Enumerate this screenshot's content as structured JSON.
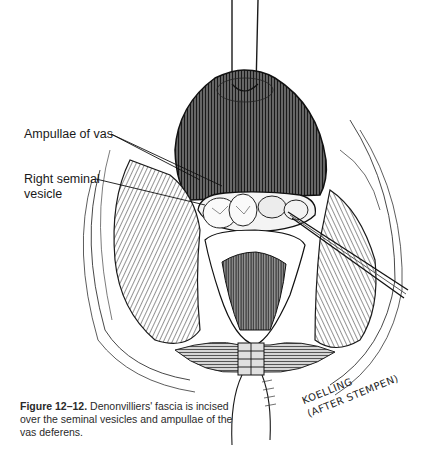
{
  "figure": {
    "labels": {
      "ampullae": "Ampullae of vas",
      "seminal_line1": "Right seminal",
      "seminal_line2": "vesicle"
    },
    "caption": {
      "number": "Figure 12–12.",
      "text": " Denonvilliers' fascia is incised over the seminal vesicles and ampullae of the vas deferens."
    },
    "signature": {
      "line1": "KOELLING",
      "line2": "(AFTER STEMPEN)"
    },
    "colors": {
      "ink": "#1a1a1a",
      "shade_dark": "#3a3a3a",
      "shade_mid": "#8a8a8a",
      "shade_light": "#d0d0d0",
      "paper": "#ffffff"
    }
  }
}
